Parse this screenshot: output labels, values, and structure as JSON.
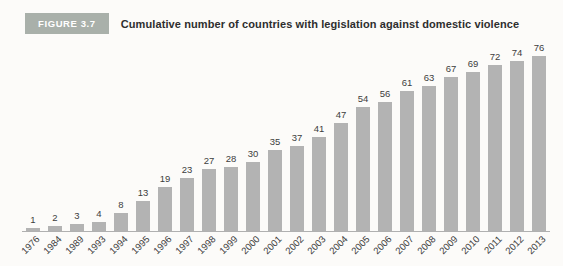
{
  "header": {
    "figure_label": "FIGURE 3.7",
    "title": "Cumulative number of countries with legislation against domestic violence"
  },
  "colors": {
    "background": "#fcfbf9",
    "badge_bg": "#a9b0aa",
    "badge_text": "#ffffff",
    "title_text": "#2e2e2e",
    "bar": "#b3b3b3",
    "value_label_text": "#3d3d3d",
    "year_label_text": "#3a3a3a",
    "axis_line": "#b0b0b0"
  },
  "chart_data": {
    "type": "bar",
    "title": "Cumulative number of countries with legislation against domestic violence",
    "categories": [
      "1976",
      "1984",
      "1989",
      "1993",
      "1994",
      "1995",
      "1996",
      "1997",
      "1998",
      "1999",
      "2000",
      "2001",
      "2002",
      "2003",
      "2004",
      "2005",
      "2006",
      "2007",
      "2008",
      "2009",
      "2010",
      "2011",
      "2012",
      "2013"
    ],
    "values": [
      1,
      2,
      3,
      4,
      8,
      13,
      19,
      23,
      27,
      28,
      30,
      35,
      37,
      41,
      47,
      54,
      56,
      61,
      63,
      67,
      69,
      72,
      74,
      76
    ],
    "xlabel": "",
    "ylabel": "",
    "ylim": [
      0,
      80
    ],
    "grid": false,
    "legend_position": "none",
    "value_labels_shown": true,
    "x_tick_rotation_deg": 45
  }
}
